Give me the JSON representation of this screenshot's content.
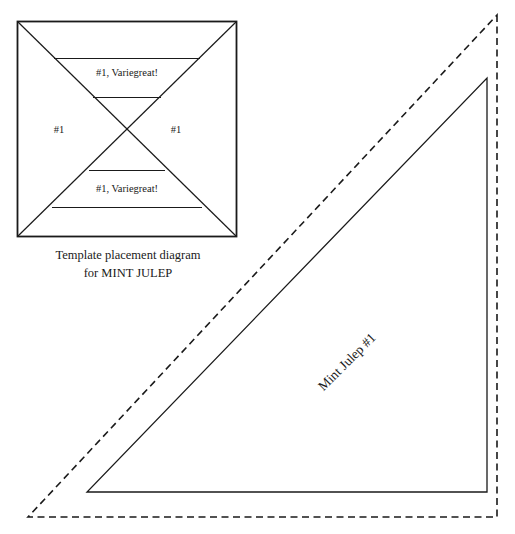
{
  "page": {
    "background_color": "#ffffff",
    "line_color": "#1a1a1a",
    "text_color": "#1a1a1a",
    "width": 515,
    "height": 534
  },
  "template_diagram": {
    "name": "template-placement-diagram",
    "caption_line1": "Template placement diagram",
    "caption_line2": "for MINT JULEP",
    "square": {
      "x": 17,
      "y": 21,
      "width": 220,
      "height": 216
    },
    "labels": {
      "top_wedge": "#1, Variegreat!",
      "bottom_wedge": "#1, Variegreat!",
      "left_wedge": "#1",
      "right_wedge": "#1"
    },
    "horizontal_divider_y": [
      58,
      97,
      170,
      207
    ]
  },
  "piece": {
    "name": "mint-julep-piece",
    "label": "Mint Julep #1",
    "label_rotation_deg": -45,
    "solid_triangle": {
      "apex": [
        487,
        78
      ],
      "bottom_left": [
        87,
        492
      ],
      "bottom_right": [
        487,
        492
      ]
    },
    "dashed_seam_allowance_triangle": {
      "apex": [
        497,
        15
      ],
      "bottom_left": [
        28,
        517
      ],
      "bottom_right": [
        497,
        517
      ]
    }
  }
}
